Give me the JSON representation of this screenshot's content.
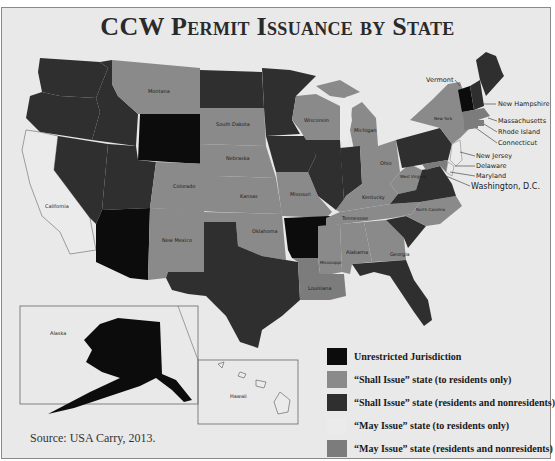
{
  "title": "CCW Permit Issuance by State",
  "source": "Source: USA Carry, 2013.",
  "colors": {
    "unrestricted": "#0c0c0c",
    "shall_residents": "#8a8a8a",
    "shall_nonresidents": "#2f2f2f",
    "may_residents": "#ebebeb",
    "may_nonresidents": "#7c7c7c",
    "background": "#e9e9e9"
  },
  "legend": [
    {
      "label": "Unrestricted Jurisdiction",
      "color": "#0c0c0c"
    },
    {
      "label": "“Shall Issue” state (to residents only)",
      "color": "#8a8a8a"
    },
    {
      "label": "“Shall Issue” state (residents and nonresidents)",
      "color": "#2f2f2f"
    },
    {
      "label": "“May Issue” state (to residents only)",
      "color": "#ebebeb"
    },
    {
      "label": "“May Issue” state (residents and nonresidents)",
      "color": "#7c7c7c"
    }
  ],
  "state_labels": {
    "california": "California",
    "montana": "Montana",
    "colorado": "Colorado",
    "new_mexico": "New Mexico",
    "south_dakota": "South Dakota",
    "nebraska": "Nebraska",
    "kansas": "Kansas",
    "oklahoma": "Oklahoma",
    "missouri": "Missouri",
    "wisconsin": "Wisconsin",
    "michigan": "Michigan",
    "ohio": "Ohio",
    "kentucky": "Kentucky",
    "west_virginia": "West Virginia",
    "tennessee": "Tennessee",
    "north_carolina": "North Carolina",
    "mississippi": "Mississippi",
    "alabama": "Alabama",
    "georgia": "Georgia",
    "louisiana": "Louisiana",
    "new_york": "New York",
    "alaska": "Alaska",
    "hawaii": "Hawaii"
  },
  "callouts": {
    "vermont": "Vermont",
    "new_hampshire": "New Hampshire",
    "massachusetts": "Massachusetts",
    "rhode_island": "Rhode Island",
    "connecticut": "Connecticut",
    "new_jersey": "New Jersey",
    "delaware": "Delaware",
    "maryland": "Maryland",
    "dc": "Washington, D.C."
  },
  "state_categories": {
    "unrestricted": [
      "Vermont",
      "Wyoming",
      "Arizona",
      "Arkansas",
      "Alaska"
    ],
    "shall_issue_residents_only": [
      "Montana",
      "South Dakota",
      "Nebraska",
      "Kansas",
      "Colorado",
      "New Mexico",
      "Oklahoma",
      "Missouri",
      "Wisconsin",
      "Michigan",
      "Ohio",
      "Kentucky",
      "West Virginia",
      "Tennessee",
      "North Carolina",
      "Mississippi",
      "Alabama",
      "Georgia",
      "Louisiana"
    ],
    "shall_issue_residents_and_nonresidents": [
      "Washington",
      "Oregon",
      "Idaho",
      "Nevada",
      "Utah",
      "North Dakota",
      "Minnesota",
      "Iowa",
      "Illinois",
      "Indiana",
      "Texas",
      "Florida",
      "South Carolina",
      "Virginia",
      "Pennsylvania",
      "Maine",
      "New Hampshire"
    ],
    "may_issue_residents_only": [
      "California",
      "Hawaii",
      "New Jersey",
      "Delaware",
      "Washington, D.C."
    ],
    "may_issue_residents_and_nonresidents": [
      "New York",
      "Massachusetts",
      "Rhode Island",
      "Connecticut",
      "Maryland"
    ]
  }
}
